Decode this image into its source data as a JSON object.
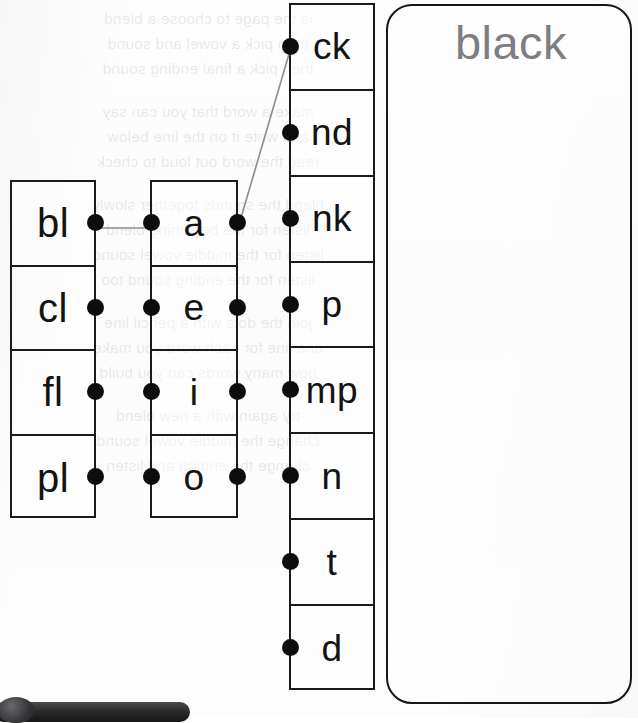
{
  "worksheet": {
    "title": "Blend Word Builder",
    "columns": [
      {
        "id": "onsets",
        "name": "initial-blends",
        "cells": [
          {
            "label": "bl",
            "dots": [
              "right"
            ]
          },
          {
            "label": "cl",
            "dots": [
              "right"
            ]
          },
          {
            "label": "fl",
            "dots": [
              "right"
            ]
          },
          {
            "label": "pl",
            "dots": [
              "right"
            ]
          }
        ]
      },
      {
        "id": "vowels",
        "name": "medial-vowels",
        "cells": [
          {
            "label": "a",
            "dots": [
              "left",
              "right"
            ]
          },
          {
            "label": "e",
            "dots": [
              "left",
              "right"
            ]
          },
          {
            "label": "i",
            "dots": [
              "left",
              "right"
            ]
          },
          {
            "label": "o",
            "dots": [
              "left",
              "right"
            ]
          }
        ]
      },
      {
        "id": "rimes",
        "name": "final-endings",
        "cells": [
          {
            "label": "ck",
            "dots": [
              "left"
            ]
          },
          {
            "label": "nd",
            "dots": [
              "left"
            ]
          },
          {
            "label": "nk",
            "dots": [
              "left"
            ]
          },
          {
            "label": "p",
            "dots": [
              "left"
            ]
          },
          {
            "label": "mp",
            "dots": [
              "left"
            ]
          },
          {
            "label": "n",
            "dots": [
              "left"
            ]
          },
          {
            "label": "t",
            "dots": [
              "left"
            ]
          },
          {
            "label": "d",
            "dots": [
              "left"
            ]
          }
        ]
      }
    ],
    "connections": [
      {
        "from": "bl",
        "to": "a",
        "x1": 95,
        "y1": 228,
        "x2": 150,
        "y2": 228
      },
      {
        "from": "a",
        "to": "ck",
        "x1": 238,
        "y1": 228,
        "x2": 289,
        "y2": 54
      }
    ],
    "answer": {
      "label": "answer-panel",
      "word": "black",
      "color": "#7e7e80"
    },
    "ghost_text": "is the page to choose a blend\nthen pick a vowel and sound\nthen pick a final ending sound\n\nmake a word that you can say\nand write it on the line below\nread the word out loud to check\n\nblend the sounds together slowly\nlisten for the beginning blend\nlisten for the middle vowel sound\nlisten for the ending sound too\n\njoin the dots with a pencil line\none line for each word you make\nhow many words can you build\n\ntry again with a new blend\nchange the middle vowel sound\nchange the ending and listen"
  }
}
